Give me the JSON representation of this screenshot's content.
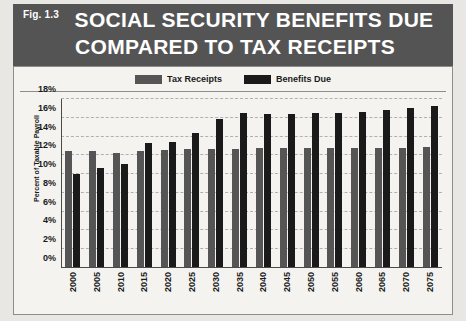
{
  "figure": {
    "fig_label": "Fig. 1.3",
    "title_line_1": "SOCIAL SECURITY BENEFITS DUE",
    "title_line_2": "COMPARED TO TAX RECEIPTS",
    "header_color": "#545454",
    "panel_color": "#f4f3f0"
  },
  "legend": {
    "position": "top-center",
    "entries": [
      {
        "label": "Tax Receipts",
        "color": "#555555"
      },
      {
        "label": "Benefits Due",
        "color": "#1a1a1a"
      }
    ]
  },
  "chart_data": {
    "type": "bar",
    "title": "SOCIAL SECURITY BENEFITS DUE COMPARED TO TAX RECEIPTS",
    "xlabel": "",
    "ylabel": "Percent of Taxable Payroll",
    "categories": [
      "2000",
      "2005",
      "2010",
      "2015",
      "2020",
      "2025",
      "2030",
      "2035",
      "2040",
      "2045",
      "2050",
      "2055",
      "2060",
      "2065",
      "2070",
      "2075"
    ],
    "series": [
      {
        "name": "Tax Receipts",
        "color": "#555555",
        "values": [
          12.5,
          12.5,
          12.2,
          12.5,
          12.6,
          12.7,
          12.7,
          12.7,
          12.8,
          12.8,
          12.8,
          12.8,
          12.8,
          12.8,
          12.8,
          12.9
        ]
      },
      {
        "name": "Benefits Due",
        "color": "#1a1a1a",
        "values": [
          10.0,
          10.7,
          11.1,
          13.3,
          13.4,
          14.4,
          15.9,
          16.5,
          16.4,
          16.4,
          16.5,
          16.5,
          16.6,
          16.8,
          17.0,
          17.3
        ]
      }
    ],
    "ylim": [
      0,
      18
    ],
    "ytick_labels": [
      "0%",
      "2%",
      "4%",
      "6%",
      "8%",
      "10%",
      "12%",
      "14%",
      "16%",
      "18%"
    ],
    "ytick_values": [
      0,
      2,
      4,
      6,
      8,
      10,
      12,
      14,
      16,
      18
    ],
    "grid": true,
    "grid_style": "dashed-horizontal"
  }
}
